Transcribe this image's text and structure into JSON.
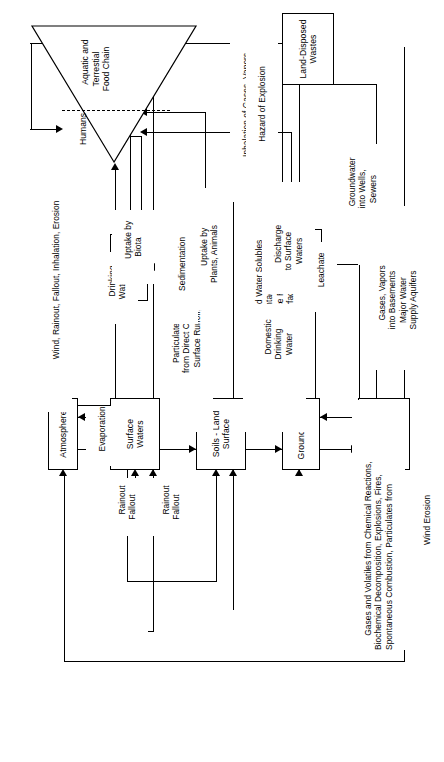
{
  "diagram": {
    "orientation": "rotated-90-ccw"
  },
  "boxes": {
    "atmosphere": "Atmosphere",
    "surface_waters": "Surface\nWaters",
    "soils_land_surface": "Soils - Land\nSurface",
    "groundwater": "Groundwater",
    "subsurface_formations": "Subsurface\nFormations",
    "sediments": "Sediments",
    "subsurface_construction": "Subsurface\nConstruction",
    "land_disposed_wastes": "Land-Disposed\nWastes"
  },
  "receptor": {
    "humans": "Humans",
    "food_chain": "Aquatic and\nTerrestial\nFood Chain"
  },
  "labels": {
    "gases_volatiles": "Gases and Volatiles from Chemical Reactions,\nBiochemical Decomposition, Explosions, Fires,\nSpontaneous Combustion, Particulates from",
    "wind_erosion": "Wind Erosion",
    "rainout_fallout_a": "Rainout\nFallout",
    "rainout_fallout_b": "Rainout\nFallout",
    "particulates_surface_flows": "Particulates and Water Solubles\nfrom Direct Contact of Waste with\nSurface Runoff, Surface Flows",
    "particulates_leachate_seeps": "Particulates and Water Solubles\nfrom Direct Contact of Waste\nwith Surface Runoff,\nLeachate Surface Seeps",
    "evaporation": "Evaporation",
    "sedimentation": "Sedimentation",
    "drinking_water": "Drinking\nWater",
    "uptake_by_biota": "Uptake by\nBiota",
    "uptake_plants_animals": "Uptake by\nPlants, Animals",
    "discharge_surface_waters": "Discharge\nto Surface\nWaters",
    "domestic_drinking_water": "Domestic\nDrinking\nWater",
    "groundwater_wells_sewers": "Groundwater\ninto Wells,\nSewers",
    "gases_vapors_basements": "Gases, Vapors\ninto Basements\nMajor Water\nSupply Aquifers",
    "inhalation_gases_vapors": "Inhalation of Gases, Vapors",
    "hazard_explosion": "Hazard of Explosion",
    "wind_rainout_fallout_inhalation_erosion": "Wind, Rainout, Fallout, Inhalation, Erosion",
    "leachate": "Leachate",
    "lateral_migration": "Lateral Migration\nof Gases, Vapors"
  },
  "colors": {
    "stroke": "#000000",
    "background": "#ffffff"
  }
}
